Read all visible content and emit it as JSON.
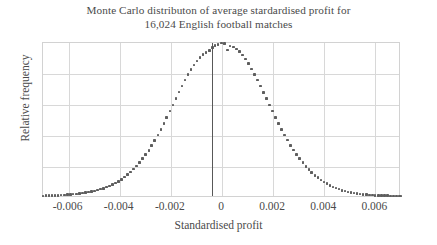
{
  "chart_data": {
    "type": "scatter",
    "title": "Monte Carlo distributon of average stardardised profit for 16,024 English football matches",
    "title_lines": [
      "Monte Carlo distributon of average stardardised profit for",
      "16,024 English football matches"
    ],
    "xlabel": "Standardised profit",
    "ylabel": "Relative frequency",
    "xlim": [
      -0.007,
      0.007
    ],
    "ylim": [
      0,
      1.0
    ],
    "xticks": [
      -0.006,
      -0.004,
      -0.002,
      0,
      0.002,
      0.004,
      0.006
    ],
    "xticklabels": [
      "-0.006",
      "-0.004",
      "-0.002",
      "0",
      "0.002",
      "0.004",
      "0.006"
    ],
    "yticklabels": [],
    "grid": true,
    "grid_horizontal_count": 4,
    "legend": null,
    "marker_color": "#5e5e5e",
    "gridline_color": "#d8d8d8",
    "axis_border_color": "#d2d2d2",
    "reference_line": {
      "label": "observed average standardised profit",
      "x": -0.0004,
      "color": "#585858",
      "orientation": "vertical"
    },
    "distribution": {
      "shape": "normal",
      "mean": -5e-05,
      "sigma": 0.00165,
      "peak_relative_frequency": 1.0,
      "n_points": 120,
      "noise_amplitude": 0.022
    },
    "x": [
      -0.007,
      -0.00688,
      -0.00676,
      -0.00664,
      -0.00653,
      -0.00641,
      -0.00629,
      -0.00617,
      -0.00605,
      -0.00593,
      -0.00582,
      -0.0057,
      -0.00558,
      -0.00546,
      -0.00534,
      -0.00523,
      -0.00511,
      -0.00499,
      -0.00487,
      -0.00475,
      -0.00464,
      -0.00452,
      -0.0044,
      -0.00428,
      -0.00416,
      -0.00405,
      -0.00393,
      -0.00381,
      -0.00369,
      -0.00357,
      -0.00345,
      -0.00334,
      -0.00322,
      -0.0031,
      -0.00298,
      -0.00286,
      -0.00275,
      -0.00263,
      -0.00251,
      -0.00239,
      -0.00227,
      -0.00216,
      -0.00204,
      -0.00192,
      -0.0018,
      -0.00168,
      -0.00157,
      -0.00145,
      -0.00133,
      -0.00121,
      -0.00109,
      -0.00097,
      -0.00086,
      -0.00074,
      -0.00062,
      -0.0005,
      -0.00038,
      -0.00027,
      -0.00015,
      -3e-05,
      9e-05,
      0.00021,
      0.00032,
      0.00044,
      0.00056,
      0.00068,
      0.0008,
      0.00092,
      0.00103,
      0.00115,
      0.00127,
      0.00139,
      0.00151,
      0.00162,
      0.00174,
      0.00186,
      0.00198,
      0.0021,
      0.00221,
      0.00233,
      0.00245,
      0.00257,
      0.00269,
      0.0028,
      0.00292,
      0.00304,
      0.00316,
      0.00328,
      0.0034,
      0.00351,
      0.00363,
      0.00375,
      0.00387,
      0.00399,
      0.0041,
      0.00422,
      0.00434,
      0.00446,
      0.00458,
      0.00469,
      0.00481,
      0.00493,
      0.00505,
      0.00517,
      0.00528,
      0.0054,
      0.00552,
      0.00564,
      0.00576,
      0.00588,
      0.00599,
      0.00611,
      0.00623,
      0.00635,
      0.00647,
      0.00658,
      0.0067,
      0.00682,
      0.00694,
      0.007
    ],
    "y": [
      0.014,
      0.015,
      0.016,
      0.016,
      0.017,
      0.018,
      0.019,
      0.02,
      0.022,
      0.023,
      0.025,
      0.027,
      0.029,
      0.032,
      0.035,
      0.038,
      0.042,
      0.046,
      0.051,
      0.057,
      0.063,
      0.07,
      0.078,
      0.087,
      0.097,
      0.108,
      0.121,
      0.135,
      0.15,
      0.167,
      0.186,
      0.206,
      0.229,
      0.253,
      0.28,
      0.308,
      0.339,
      0.372,
      0.406,
      0.443,
      0.481,
      0.52,
      0.56,
      0.601,
      0.642,
      0.683,
      0.722,
      0.76,
      0.796,
      0.829,
      0.859,
      0.885,
      0.908,
      0.926,
      0.94,
      0.95,
      0.97,
      0.985,
      0.99,
      1.0,
      0.997,
      0.955,
      0.98,
      0.975,
      0.962,
      0.944,
      0.922,
      0.896,
      0.866,
      0.833,
      0.798,
      0.761,
      0.722,
      0.682,
      0.641,
      0.6,
      0.56,
      0.52,
      0.481,
      0.443,
      0.407,
      0.373,
      0.34,
      0.309,
      0.28,
      0.253,
      0.228,
      0.205,
      0.184,
      0.165,
      0.147,
      0.131,
      0.117,
      0.104,
      0.092,
      0.081,
      0.072,
      0.064,
      0.057,
      0.05,
      0.045,
      0.04,
      0.036,
      0.032,
      0.029,
      0.026,
      0.024,
      0.022,
      0.02,
      0.019,
      0.018,
      0.017,
      0.016,
      0.015,
      0.015,
      0.014,
      0.014,
      0.014,
      0.013,
      0.013
    ]
  }
}
